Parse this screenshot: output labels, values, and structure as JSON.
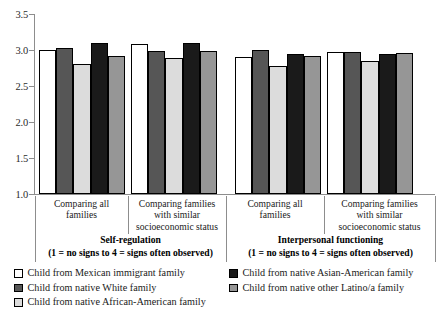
{
  "chart_data": {
    "type": "bar",
    "title": "",
    "xlabel": "",
    "ylabel": "",
    "ylim": [
      1.0,
      3.5
    ],
    "yticks": [
      "1.0",
      "1.5",
      "2.0",
      "2.5",
      "3.0",
      "3.5"
    ],
    "grid": false,
    "legend_position": "bottom",
    "categories": [
      "Comparing all families",
      "Comparing families with similar socioeconomic status",
      "Comparing all families",
      "Comparing families with similar socioeconomic status"
    ],
    "series": [
      {
        "name": "Child from Mexican immigrant family",
        "color": "#ffffff",
        "values": [
          3.0,
          3.08,
          2.9,
          2.97
        ]
      },
      {
        "name": "Child from native White family",
        "color": "#565656",
        "values": [
          3.03,
          2.99,
          3.0,
          2.97
        ]
      },
      {
        "name": "Child from native African-American family",
        "color": "#dcdcdc",
        "values": [
          2.81,
          2.89,
          2.78,
          2.85
        ]
      },
      {
        "name": "Child from native Asian-American family",
        "color": "#1a1a1a",
        "values": [
          3.1,
          3.1,
          2.94,
          2.94
        ]
      },
      {
        "name": "Child from native other Latino/a family",
        "color": "#969696",
        "values": [
          2.92,
          2.98,
          2.91,
          2.96
        ]
      }
    ],
    "sections": [
      {
        "title": "Self-regulation",
        "subtitle": "(1 = no signs to 4 = signs often observed)"
      },
      {
        "title": "Interpersonal functioning",
        "subtitle": "(1 = no signs to 4 = signs often observed)"
      }
    ]
  },
  "axis": {
    "ticks": [
      {
        "label": "3.5",
        "value": 3.5
      },
      {
        "label": "3.0",
        "value": 3.0
      },
      {
        "label": "2.5",
        "value": 2.5
      },
      {
        "label": "2.0",
        "value": 2.0
      },
      {
        "label": "1.5",
        "value": 1.5
      },
      {
        "label": "1.0",
        "value": 1.0
      }
    ]
  },
  "categories": [
    {
      "line1": "Comparing all",
      "line2": "families",
      "line3": ""
    },
    {
      "line1": "Comparing families",
      "line2": "with similar",
      "line3": "socioeconomic status"
    },
    {
      "line1": "Comparing all",
      "line2": "families",
      "line3": ""
    },
    {
      "line1": "Comparing families",
      "line2": "with similar",
      "line3": "socioeconomic status"
    }
  ],
  "sections": [
    {
      "title": "Self-regulation",
      "subtitle": "(1 = no signs to 4 = signs often observed)"
    },
    {
      "title": "Interpersonal functioning",
      "subtitle": "(1 = no signs to 4 = signs often observed)"
    }
  ],
  "legend": {
    "left": [
      {
        "label": "Child from Mexican immigrant family",
        "color": "#ffffff"
      },
      {
        "label": "Child from native White family",
        "color": "#565656"
      },
      {
        "label": "Child from native African-American family",
        "color": "#dcdcdc"
      }
    ],
    "right": [
      {
        "label": "Child from native Asian-American family",
        "color": "#1a1a1a"
      },
      {
        "label": "Child from native other Latino/a family",
        "color": "#969696"
      }
    ]
  }
}
